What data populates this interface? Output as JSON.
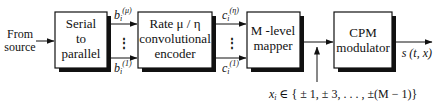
{
  "diagram": {
    "input_label": [
      "From",
      "source"
    ],
    "blocks": [
      {
        "id": "serial-to-parallel",
        "lines": [
          "Serial",
          "to",
          "parallel"
        ]
      },
      {
        "id": "convolutional-encoder",
        "lines": [
          "Rate μ / η",
          "convolutional",
          "encoder"
        ]
      },
      {
        "id": "m-level-mapper",
        "lines": [
          "M -level",
          "mapper"
        ]
      },
      {
        "id": "cpm-modulator",
        "lines": [
          "CPM",
          "modulator"
        ]
      }
    ],
    "bus1": {
      "top_base": "b",
      "top_sub": "i",
      "top_sup": "(μ)",
      "bot_base": "b",
      "bot_sub": "i",
      "bot_sup": "(1)",
      "ellipsis": "⋮"
    },
    "bus2": {
      "top_base": "c",
      "top_sub": "i",
      "top_sup": "(η)",
      "bot_base": "c",
      "bot_sub": "i",
      "bot_sup": "(1)",
      "ellipsis": "⋮"
    },
    "symbol_label": {
      "var": "x",
      "sub": "i",
      "text": " ∈ { ± 1, ± 3, . . . , ±(M − 1)}"
    },
    "output_label": "s (t, x)"
  }
}
